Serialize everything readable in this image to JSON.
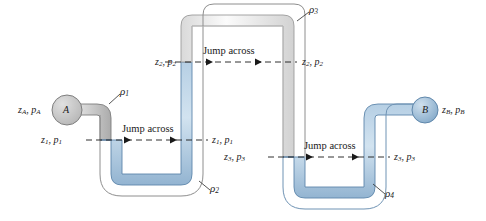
{
  "figure": {
    "type": "multi-fluid-manometer-diagram"
  },
  "colors": {
    "fluid_blue_fill": "#b8cfe3",
    "fluid_blue_edge": "#6f93b4",
    "pipe_gray_fill": "#c9c9c9",
    "pipe_gray_edge": "#8a8a8a",
    "pipe_white_fill": "#f4f4f4",
    "pipe_white_edge": "#9b9b9b",
    "reservoir_a_fill": "#c4c4c4",
    "reservoir_b_fill": "#9dbdd8",
    "text": "#1a1a1a",
    "background": "#ffffff"
  },
  "nodes": {
    "a": {
      "label": "A",
      "state_label": "z",
      "state_sub": "A",
      "state_label2": "p",
      "state_sub2": "A"
    },
    "b": {
      "label": "B",
      "state_label": "z",
      "state_sub": "B",
      "state_label2": "p",
      "state_sub2": "B"
    }
  },
  "labels": {
    "z_a_p_a": "z_A, p_A",
    "z_b_p_b": "z_B, p_B",
    "z1_p1_left": "z_1, p_1",
    "z1_p1_right": "z_1, p_1",
    "z2_p2_left": "z_2, p_2",
    "z2_p2_right": "z_2, p_2",
    "z3_p3_left": "z_3, p_3",
    "z3_p3_right": "z_3, p_3",
    "jump_across_1": "Jump across",
    "jump_across_2": "Jump across",
    "jump_across_3": "Jump across",
    "rho1": "ρ",
    "rho1_sub": "1",
    "rho2": "ρ",
    "rho2_sub": "2",
    "rho3": "ρ",
    "rho3_sub": "3",
    "rho4": "ρ",
    "rho4_sub": "4"
  },
  "densities": [
    {
      "symbol": "ρ",
      "subscript": "1",
      "fluid": "gray",
      "segment": "reservoir-A-to-first-bend"
    },
    {
      "symbol": "ρ",
      "subscript": "2",
      "fluid": "blue",
      "segment": "first-U-bend"
    },
    {
      "symbol": "ρ",
      "subscript": "3",
      "fluid": "white",
      "segment": "inverted-U-top"
    },
    {
      "symbol": "ρ",
      "subscript": "4",
      "fluid": "blue",
      "segment": "second-U-bend"
    }
  ],
  "jump_levels": [
    {
      "id": "level-1",
      "left": "z_1, p_1",
      "right": "z_1, p_1",
      "caption": "Jump across",
      "y": 140
    },
    {
      "id": "level-2",
      "left": "z_2, p_2",
      "right": "z_2, p_2",
      "caption": "Jump across",
      "y": 62
    },
    {
      "id": "level-3",
      "left": "z_3, p_3",
      "right": "z_3, p_3",
      "caption": "Jump across",
      "y": 157
    }
  ]
}
